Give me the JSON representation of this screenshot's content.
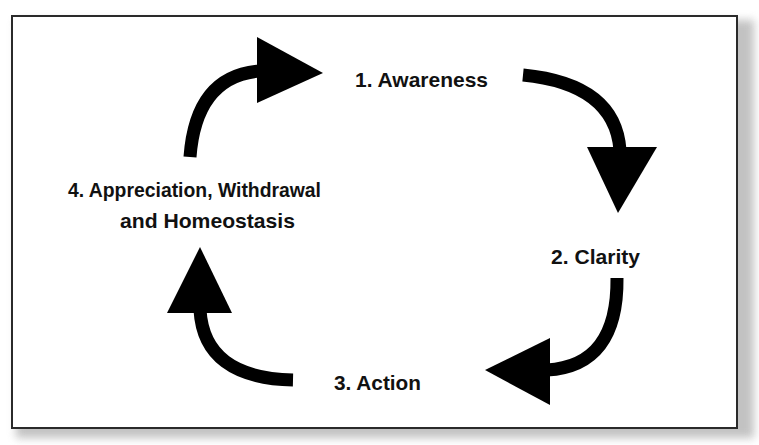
{
  "diagram": {
    "type": "cycle",
    "direction": "clockwise",
    "colors": {
      "background": "#ffffff",
      "border": "#2a2a2a",
      "arrow": "#000000",
      "text": "#111111",
      "shadow": "#b8b8b8"
    },
    "stages": [
      {
        "id": 1,
        "label": "1. Awareness",
        "position": "top"
      },
      {
        "id": 2,
        "label": "2. Clarity",
        "position": "right"
      },
      {
        "id": 3,
        "label": "3. Action",
        "position": "bottom"
      },
      {
        "id": 4,
        "label_line1": "4. Appreciation, Withdrawal",
        "label_line2": "and Homeostasis",
        "position": "left"
      }
    ],
    "arrows": [
      {
        "from": 4,
        "to": 1,
        "icon": "curved-arrow-right-icon"
      },
      {
        "from": 1,
        "to": 2,
        "icon": "curved-arrow-down-icon"
      },
      {
        "from": 2,
        "to": 3,
        "icon": "curved-arrow-left-icon"
      },
      {
        "from": 3,
        "to": 4,
        "icon": "curved-arrow-up-icon"
      }
    ]
  }
}
